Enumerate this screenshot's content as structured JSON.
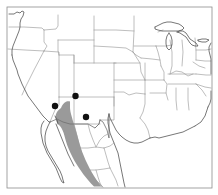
{
  "figure": {
    "type": "distribution-map",
    "region": "Western United States and Mexico",
    "background_color": "#ffffff",
    "frame_color": "#8d8d8d"
  },
  "map": {
    "frame": {
      "x": 7,
      "y": 7,
      "width": 205,
      "height": 181
    },
    "coastline_color": "#4a4a4a",
    "state_border_color": "#9b9b9b",
    "country_border_color": "#707070"
  },
  "shaded_range": {
    "label": "shaded-distribution-band",
    "color": "#9a9a9a",
    "opacity": 1,
    "description": "Gray band extending from southeastern Arizona and southwestern New Mexico southeast along the Sierra Madre Occidental into Mexico"
  },
  "localities": {
    "marker_color": "#111111",
    "marker_radius": 3.2,
    "points": [
      {
        "name": "locality-point-1",
        "x": 75.5,
        "y": 96.0
      },
      {
        "name": "locality-point-2",
        "x": 55.0,
        "y": 106.0
      },
      {
        "name": "locality-point-3",
        "x": 86.0,
        "y": 117.0
      }
    ]
  },
  "legend": {
    "visible": false,
    "items": []
  },
  "labels": {
    "title": "",
    "caption": "",
    "axis_labels": []
  }
}
